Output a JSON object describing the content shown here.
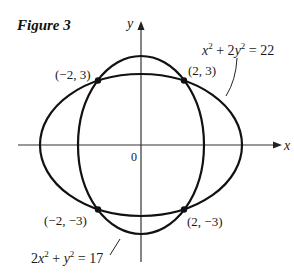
{
  "figure": {
    "title": "Figure 3",
    "axes": {
      "x_label": "x",
      "y_label": "y",
      "origin_label": "0"
    },
    "curves": [
      {
        "name": "ellipse-horizontal",
        "equation_parts": [
          "x",
          "2",
          " + 2",
          "y",
          "2",
          " = 22"
        ],
        "equation": "x² + 2y² = 22"
      },
      {
        "name": "ellipse-vertical",
        "equation_parts": [
          "2",
          "x",
          "2",
          " + ",
          "y",
          "2",
          " = 17"
        ],
        "equation": "2x² + y² = 17"
      }
    ],
    "points": [
      {
        "label": "(−2, 3)",
        "x": -2,
        "y": 3
      },
      {
        "label": "(2, 3)",
        "x": 2,
        "y": 3
      },
      {
        "label": "(−2, −3)",
        "x": -2,
        "y": -3
      },
      {
        "label": "(2, −3)",
        "x": 2,
        "y": -3
      }
    ],
    "colors": {
      "curve": "#111111",
      "axis": "#333333",
      "background": "#ffffff"
    }
  }
}
